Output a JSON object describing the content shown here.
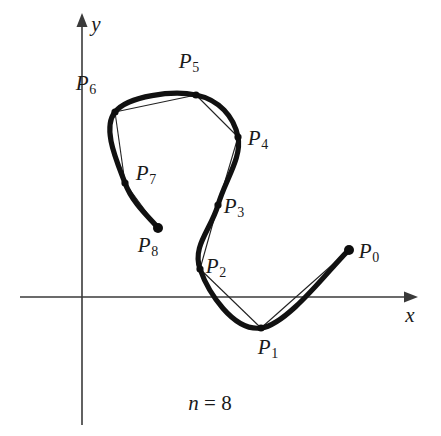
{
  "figure": {
    "caption": "n = 8",
    "caption_variable": "n",
    "caption_rest": " = 8",
    "n": 8,
    "axes": {
      "x_label": "x",
      "y_label": "y",
      "origin": [
        82,
        297
      ]
    }
  },
  "chart_data": {
    "type": "scatter",
    "title": "",
    "subtitle": "",
    "xlabel": "x",
    "ylabel": "y",
    "grid": false,
    "legend": null,
    "annotations": [
      "n = 8"
    ],
    "point_labels": [
      "P0",
      "P1",
      "P2",
      "P3",
      "P4",
      "P5",
      "P6",
      "P7",
      "P8"
    ],
    "points_px": [
      [
        349,
        250
      ],
      [
        261,
        328
      ],
      [
        200,
        269
      ],
      [
        218,
        205
      ],
      [
        238,
        137
      ],
      [
        196,
        95
      ],
      [
        115,
        112
      ],
      [
        125,
        183
      ],
      [
        158,
        228
      ]
    ],
    "points_data": [
      [
        5.93,
        1.57
      ],
      [
        3.58,
        0.83
      ],
      [
        3.15,
        0.75
      ],
      [
        3.63,
        2.46
      ],
      [
        4.17,
        4.27
      ],
      [
        3.04,
        5.39
      ],
      [
        0.88,
        4.94
      ],
      [
        1.15,
        3.04
      ],
      [
        2.03,
        1.84
      ]
    ],
    "label_positions_px": [
      [
        369,
        253
      ],
      [
        268,
        349
      ],
      [
        216,
        268
      ],
      [
        234,
        208
      ],
      [
        258,
        140
      ],
      [
        189,
        63
      ],
      [
        86,
        85
      ],
      [
        146,
        175
      ],
      [
        148,
        247
      ]
    ],
    "x_axis_px": {
      "y": 297,
      "x_start": 20,
      "x_end": 418
    },
    "y_axis_px": {
      "x": 82,
      "y_start": 13,
      "y_end": 425
    },
    "closed": false
  },
  "labels": [
    {
      "name": "P0",
      "base": "P",
      "sub": "0"
    },
    {
      "name": "P1",
      "base": "P",
      "sub": "1"
    },
    {
      "name": "P2",
      "base": "P",
      "sub": "2"
    },
    {
      "name": "P3",
      "base": "P",
      "sub": "3"
    },
    {
      "name": "P4",
      "base": "P",
      "sub": "4"
    },
    {
      "name": "P5",
      "base": "P",
      "sub": "5"
    },
    {
      "name": "P6",
      "base": "P",
      "sub": "6"
    },
    {
      "name": "P7",
      "base": "P",
      "sub": "7"
    },
    {
      "name": "P8",
      "base": "P",
      "sub": "8"
    }
  ],
  "colors": {
    "curve": "#111111",
    "chord": "#222222",
    "axis": "#3a3a3a",
    "knot": "#0d0d0d",
    "background": "#ffffff",
    "text": "#1a1a1a"
  }
}
